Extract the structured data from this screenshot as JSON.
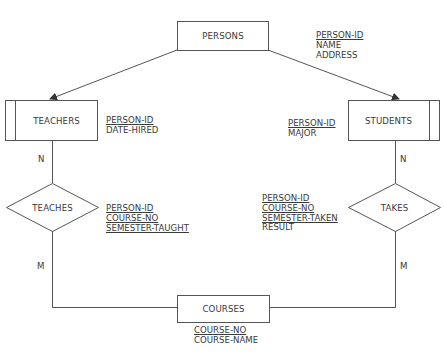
{
  "entities": {
    "persons": {
      "label": "PERSONS",
      "attributes": [
        {
          "name": "PERSON-ID",
          "key": true
        },
        {
          "name": "NAME",
          "key": false
        },
        {
          "name": "ADDRESS",
          "key": false
        }
      ]
    },
    "teachers": {
      "label": "TEACHERS",
      "attributes": [
        {
          "name": "PERSON-ID",
          "key": true
        },
        {
          "name": "DATE-HIRED",
          "key": false
        }
      ]
    },
    "students": {
      "label": "STUDENTS",
      "attributes": [
        {
          "name": "PERSON-ID",
          "key": true
        },
        {
          "name": "MAJOR",
          "key": false
        }
      ]
    },
    "courses": {
      "label": "COURSES",
      "attributes": [
        {
          "name": "COURSE-NO",
          "key": true
        },
        {
          "name": "COURSE-NAME",
          "key": false
        }
      ]
    }
  },
  "relationships": {
    "teaches": {
      "label": "TEACHES",
      "attributes": [
        {
          "name": "PERSON-ID",
          "key": true
        },
        {
          "name": "COURSE-NO",
          "key": true
        },
        {
          "name": "SEMESTER-TAUGHT",
          "key": true
        }
      ]
    },
    "takes": {
      "label": "TAKES",
      "attributes": [
        {
          "name": "PERSON-ID",
          "key": true
        },
        {
          "name": "COURSE-NO",
          "key": true
        },
        {
          "name": "SEMESTER-TAKEN",
          "key": true
        },
        {
          "name": "RESULT",
          "key": false
        }
      ]
    }
  },
  "cardinalities": {
    "teachers_teaches": "N",
    "teaches_courses": "M",
    "students_takes": "N",
    "takes_courses": "M"
  },
  "colors": {
    "stroke": "#555555",
    "text": "#3a3a3a",
    "background": "#ffffff"
  }
}
